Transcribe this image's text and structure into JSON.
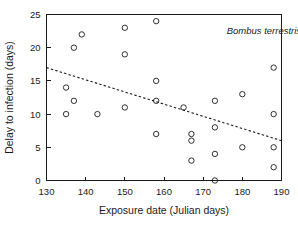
{
  "chart_data": {
    "type": "scatter",
    "title": "",
    "xlabel": "Exposure date (Julian days)",
    "ylabel": "Delay to infection (days)",
    "xlim": [
      130,
      190
    ],
    "ylim": [
      0,
      25
    ],
    "xticks": [
      130,
      140,
      150,
      160,
      170,
      180,
      190
    ],
    "yticks": [
      0,
      5,
      10,
      15,
      20,
      25
    ],
    "grid": false,
    "legend": null,
    "annotations": [
      {
        "text": "Bombus terrestris",
        "style": "italic",
        "x": 176,
        "y": 22
      }
    ],
    "marker_style": "open-circle",
    "points": [
      {
        "x": 135,
        "y": 14
      },
      {
        "x": 135,
        "y": 10
      },
      {
        "x": 137,
        "y": 20
      },
      {
        "x": 137,
        "y": 12
      },
      {
        "x": 139,
        "y": 22
      },
      {
        "x": 143,
        "y": 10
      },
      {
        "x": 150,
        "y": 23
      },
      {
        "x": 150,
        "y": 19
      },
      {
        "x": 150,
        "y": 11
      },
      {
        "x": 158,
        "y": 24
      },
      {
        "x": 158,
        "y": 15
      },
      {
        "x": 158,
        "y": 12
      },
      {
        "x": 158,
        "y": 7
      },
      {
        "x": 165,
        "y": 11
      },
      {
        "x": 167,
        "y": 7
      },
      {
        "x": 167,
        "y": 6
      },
      {
        "x": 167,
        "y": 3
      },
      {
        "x": 173,
        "y": 12
      },
      {
        "x": 173,
        "y": 8
      },
      {
        "x": 173,
        "y": 4
      },
      {
        "x": 173,
        "y": 0
      },
      {
        "x": 180,
        "y": 13
      },
      {
        "x": 180,
        "y": 5
      },
      {
        "x": 188,
        "y": 17
      },
      {
        "x": 188,
        "y": 10
      },
      {
        "x": 188,
        "y": 5
      },
      {
        "x": 188,
        "y": 2
      }
    ],
    "trend_line": {
      "style": "dashed",
      "x_start": 130,
      "y_start": 17,
      "x_end": 190,
      "y_end": 6
    }
  }
}
